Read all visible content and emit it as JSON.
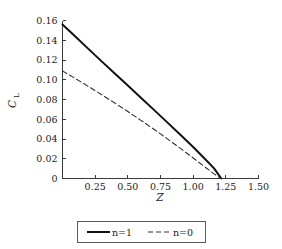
{
  "chart_data": {
    "type": "line",
    "title": "",
    "xlabel": "Z",
    "ylabel": "C_L",
    "ylabel_main": "C",
    "ylabel_sub": "L",
    "xlim": [
      0,
      1.5
    ],
    "ylim": [
      0,
      0.16
    ],
    "grid": false,
    "legend_position": "below-plot-center",
    "xticks": [
      0,
      0.25,
      0.5,
      0.75,
      1.0,
      1.25,
      1.5
    ],
    "xtick_labels": [
      "",
      "0.25",
      "0.50",
      "0.75",
      "1.00",
      "1.25",
      "1.50"
    ],
    "yticks": [
      0,
      0.02,
      0.04,
      0.06,
      0.08,
      0.1,
      0.12,
      0.14,
      0.16
    ],
    "ytick_labels": [
      "0",
      "0.02",
      "0.04",
      "0.06",
      "0.08",
      "0.10",
      "0.12",
      "0.14",
      "0.16"
    ],
    "series": [
      {
        "name": "n=1",
        "style": "solid",
        "color": "#111111",
        "width": 2.0,
        "x": [
          0.0,
          0.1,
          0.2,
          0.3,
          0.4,
          0.5,
          0.6,
          0.7,
          0.8,
          0.9,
          1.0,
          1.1,
          1.16,
          1.215
        ],
        "y": [
          0.156,
          0.1435,
          0.131,
          0.1186,
          0.1063,
          0.0941,
          0.0818,
          0.0695,
          0.0571,
          0.0446,
          0.0319,
          0.0185,
          0.0103,
          0.0
        ]
      },
      {
        "name": "n=0",
        "style": "dashed",
        "color": "#2e2e2e",
        "width": 1.1,
        "x": [
          0.0,
          0.1,
          0.2,
          0.3,
          0.4,
          0.5,
          0.6,
          0.7,
          0.8,
          0.9,
          1.0,
          1.1,
          1.16,
          1.215
        ],
        "y": [
          0.109,
          0.1011,
          0.0931,
          0.0849,
          0.0764,
          0.0678,
          0.0589,
          0.0498,
          0.0404,
          0.0307,
          0.0208,
          0.0106,
          0.0047,
          0.0
        ]
      }
    ]
  },
  "legend": {
    "entries": [
      {
        "label": "n=1",
        "style": "solid"
      },
      {
        "label": "n=0",
        "style": "dashed"
      }
    ]
  }
}
